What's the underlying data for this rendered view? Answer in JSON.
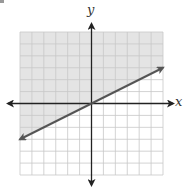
{
  "chart_data": {
    "type": "line",
    "title": "",
    "xlabel": "x",
    "ylabel": "y",
    "xlim": [
      -6,
      6
    ],
    "ylim": [
      -6,
      6
    ],
    "grid": true,
    "grid_step": 1,
    "series": [
      {
        "name": "boundary line y = x/2",
        "style": "solid",
        "arrows": "both",
        "x": [
          -6,
          6
        ],
        "y": [
          -3,
          3
        ],
        "color": "#555555"
      }
    ],
    "shaded_region": {
      "inequality": "y >= (1/2)x",
      "side": "above",
      "color": "#e6e6e6"
    },
    "legend": null
  },
  "colors": {
    "grid": "#c8c8c8",
    "axis": "#222222",
    "line": "#555555",
    "shade": "#e4e4e4"
  },
  "layout": {
    "left": 20,
    "top": 32,
    "size": 143,
    "cells": 12
  }
}
